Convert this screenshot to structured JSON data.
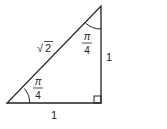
{
  "diagram": {
    "type": "right-triangle",
    "labels": {
      "base": "1",
      "height": "1",
      "hypotenuse": "2",
      "hypotenuse_prefix": "√",
      "angle_top_num": "π",
      "angle_top_den": "4",
      "angle_bottom_num": "π",
      "angle_bottom_den": "4"
    },
    "colors": {
      "stroke": "#222222",
      "background": "#ffffff"
    }
  }
}
